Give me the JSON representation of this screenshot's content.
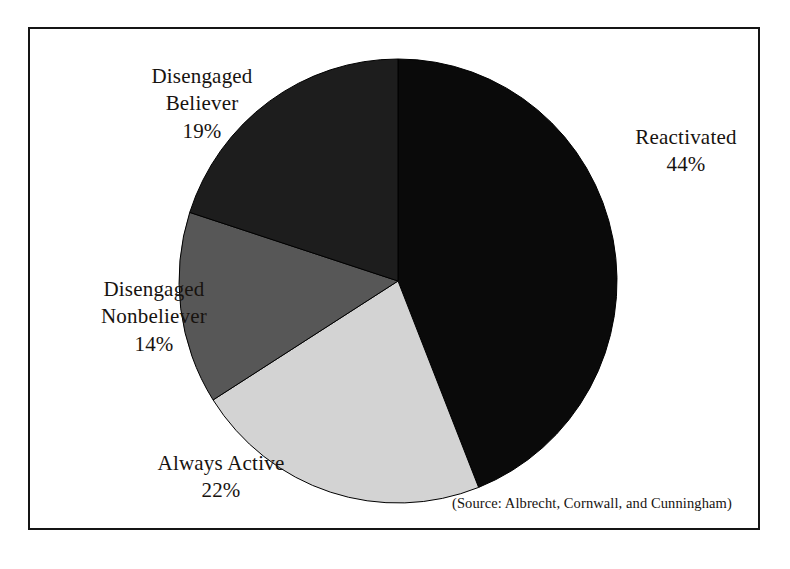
{
  "figure": {
    "background_color": "#ffffff",
    "frame_color": "#151515",
    "source_note": "(Source: Albrecht, Cornwall, and Cunningham)"
  },
  "labels": {
    "reactivated": {
      "name": "Reactivated",
      "pct": "44%"
    },
    "disengaged_believer": {
      "name_line1": "Disengaged",
      "name_line2": "Believer",
      "pct": "19%"
    },
    "disengaged_nonbeliever": {
      "name_line1": "Disengaged",
      "name_line2": "Nonbeliever",
      "pct": "14%"
    },
    "always_active": {
      "name": "Always Active",
      "pct": "22%"
    }
  },
  "chart_data": {
    "type": "pie",
    "title": "",
    "subtitle": "",
    "xlabel": "",
    "ylabel": "",
    "legend_position": "none",
    "grid": false,
    "labels_inline": true,
    "start_angle_deg": 0,
    "direction": "clockwise",
    "units": "percent",
    "total": 99,
    "categories": [
      "Reactivated",
      "Always Active",
      "Disengaged Nonbeliever",
      "Disengaged Believer"
    ],
    "values": [
      44,
      22,
      14,
      19
    ],
    "value_labels": [
      "44%",
      "22%",
      "14%",
      "19%"
    ],
    "colors": [
      "#0a0a0a",
      "#d3d3d3",
      "#575757",
      "#1d1d1d"
    ],
    "slices": [
      {
        "label": "Reactivated",
        "value": 44,
        "value_label": "44%",
        "color": "#0a0a0a",
        "start_deg": 0,
        "end_deg": 158.4
      },
      {
        "label": "Always Active",
        "value": 22,
        "value_label": "22%",
        "color": "#d3d3d3",
        "start_deg": 158.4,
        "end_deg": 237.6
      },
      {
        "label": "Disengaged Nonbeliever",
        "value": 14,
        "value_label": "14%",
        "color": "#575757",
        "start_deg": 237.6,
        "end_deg": 288.0
      },
      {
        "label": "Disengaged Believer",
        "value": 19,
        "value_label": "19%",
        "color": "#1d1d1d",
        "start_deg": 288.0,
        "end_deg": 360.0
      }
    ],
    "annotations": [
      "(Source: Albrecht, Cornwall, and Cunningham)"
    ],
    "geometry": {
      "cx": 398,
      "cy": 281,
      "rx": 219,
      "ry": 222
    }
  }
}
